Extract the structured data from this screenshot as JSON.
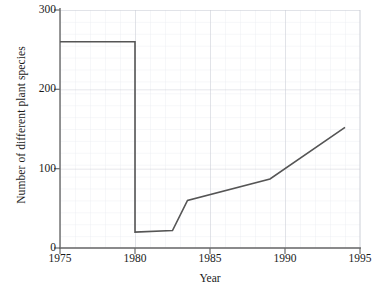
{
  "chart_data": {
    "type": "line",
    "title": "",
    "xlabel": "Year",
    "ylabel": "Number of different plant species",
    "xlim": [
      1975,
      1995
    ],
    "ylim": [
      0,
      300
    ],
    "xticks": [
      1975,
      1980,
      1985,
      1990,
      1995
    ],
    "yticks": [
      0,
      100,
      200,
      300
    ],
    "grid": true,
    "minor_grid": true,
    "legend": false,
    "line_color": "#555555",
    "grid_color": "#c9cdd6",
    "minor_grid_color": "#e6e9ee",
    "axis_color": "#6b6b6b",
    "series": [
      {
        "name": "Number of different plant species",
        "x": [
          1975,
          1980,
          1980,
          1982.5,
          1983.5,
          1989,
          1994
        ],
        "values": [
          260,
          260,
          20,
          22,
          60,
          87,
          152
        ]
      }
    ],
    "annotations": [
      "Population of plant species remains constant at about 260 from 1975 to 1980",
      "Sudden drop to about 20 species in 1980",
      "Slow recovery from 1980 to 1982.5 reaching about 22",
      "Rapid rise to about 60 by 1983.5",
      "Gradual rise to about 87 by 1989",
      "Steeper rise to about 152 by 1994"
    ]
  },
  "axes": {
    "y_tick_labels": [
      "300",
      "200",
      "100",
      "0"
    ],
    "x_tick_labels": [
      "1975",
      "1980",
      "1985",
      "1990",
      "1995"
    ],
    "y_axis_title": "Number of different plant species",
    "x_axis_title": "Year"
  }
}
